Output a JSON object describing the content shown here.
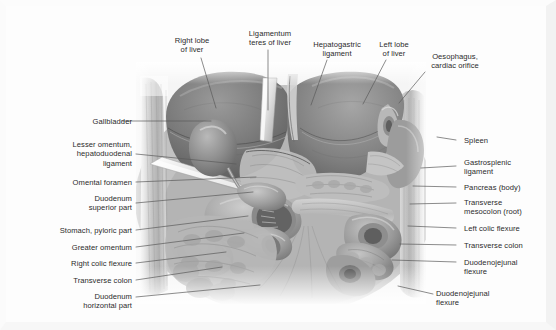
{
  "figure": {
    "illustration_name": "abdominal-viscera-illustration",
    "colors": {
      "text": "#2b2b2b",
      "leader_line": "#5a5a5a",
      "background": "#ffffff",
      "frame": "#f2f2f2",
      "liver_dark": "#6f6f6f",
      "liver_mid": "#8a8a8a",
      "viscera_light": "#b4b4b4",
      "highlight": "#dcdcdc"
    }
  },
  "labels": {
    "top": [
      {
        "id": "right-lobe-of-liver",
        "text": "Right lobe\nof liver",
        "align": "center",
        "x": 163,
        "y": 36,
        "w": 58
      },
      {
        "id": "ligamentum-teres",
        "text": "Ligamentum\nteres of liver",
        "align": "center",
        "x": 239,
        "y": 29,
        "w": 62
      },
      {
        "id": "hepatogastric-ligament",
        "text": "Hepatogastric\nligament",
        "align": "center",
        "x": 306,
        "y": 40,
        "w": 62
      },
      {
        "id": "left-lobe-of-liver",
        "text": "Left lobe\nof liver",
        "align": "center",
        "x": 371,
        "y": 40,
        "w": 46
      },
      {
        "id": "oesophagus-cardiac",
        "text": "Oesophagus,\ncardiac orifice",
        "align": "center",
        "x": 420,
        "y": 52,
        "w": 70
      }
    ],
    "left": [
      {
        "id": "gallbladder",
        "text": "Gallbladder",
        "x": 22,
        "y": 117,
        "w": 110
      },
      {
        "id": "lesser-omentum-hepatoduodenal",
        "text": "Lesser omentum,\nhepatoduodenal\nligament",
        "x": 22,
        "y": 140,
        "w": 110
      },
      {
        "id": "omental-foramen",
        "text": "Omental foramen",
        "x": 22,
        "y": 178,
        "w": 110
      },
      {
        "id": "duodenum-superior-part",
        "text": "Duodenum\nsuperior part",
        "x": 22,
        "y": 194,
        "w": 110
      },
      {
        "id": "stomach-pyloric-part",
        "text": "Stomach, pyloric part",
        "x": 12,
        "y": 226,
        "w": 120
      },
      {
        "id": "greater-omentum",
        "text": "Greater omentum",
        "x": 22,
        "y": 243,
        "w": 110
      },
      {
        "id": "right-colic-flexure",
        "text": "Right colic flexure",
        "x": 22,
        "y": 259,
        "w": 110
      },
      {
        "id": "transverse-colon-left",
        "text": "Transverse colon",
        "x": 22,
        "y": 276,
        "w": 110
      },
      {
        "id": "duodenum-horizontal-part",
        "text": "Duodenum\nhorizontal part",
        "x": 22,
        "y": 292,
        "w": 110
      }
    ],
    "right": [
      {
        "id": "spleen",
        "text": "Spleen",
        "x": 464,
        "y": 136,
        "w": 86
      },
      {
        "id": "gastrosplenic-ligament",
        "text": "Gastrosplenic\nligament",
        "x": 464,
        "y": 158,
        "w": 86
      },
      {
        "id": "pancreas-body",
        "text": "Pancreas (body)",
        "x": 464,
        "y": 183,
        "w": 86
      },
      {
        "id": "transverse-mesocolon-root",
        "text": "Transverse\nmesocolon (root)",
        "x": 464,
        "y": 198,
        "w": 86
      },
      {
        "id": "left-colic-flexure",
        "text": "Left colic flexure",
        "x": 464,
        "y": 224,
        "w": 86
      },
      {
        "id": "transverse-colon-right",
        "text": "Transverse colon",
        "x": 464,
        "y": 241,
        "w": 86
      },
      {
        "id": "duodenojejunal-flexure",
        "text": "Duodenojejunal\nflexure",
        "x": 464,
        "y": 258,
        "w": 86
      }
    ],
    "bottom_right": [
      {
        "id": "duodenojejunal-flexure-lower",
        "text": "Duodenojejunal\nflexure",
        "x": 436,
        "y": 289,
        "w": 90
      }
    ]
  },
  "leader_lines": {
    "name": "label-leader-lines",
    "top": [
      {
        "id": "leader-right-lobe",
        "d": "M 201 58  L 216 108"
      },
      {
        "id": "leader-ligamentum-teres",
        "d": "M 268 50  L 268 110"
      },
      {
        "id": "leader-hepatogastric",
        "d": "M 327 60  L 311 105"
      },
      {
        "id": "leader-left-lobe",
        "d": "M 386 60  L 363 104"
      },
      {
        "id": "leader-oesophagus",
        "d": "M 425 72  L 399 103"
      }
    ],
    "left": [
      {
        "id": "leader-gallbladder",
        "d": "M 122 121 L 211 121"
      },
      {
        "id": "leader-lesser-omentum",
        "d": "M 136 154 L 236 164"
      },
      {
        "id": "leader-omental-foramen",
        "d": "M 136 182 L 256 177"
      },
      {
        "id": "leader-duodenum-superior",
        "d": "M 136 203 L 253 192"
      },
      {
        "id": "leader-stomach-pyloric",
        "d": "M 136 230 L 248 216"
      },
      {
        "id": "leader-greater-omentum",
        "d": "M 136 247 L 244 233"
      },
      {
        "id": "leader-right-colic-flexure",
        "d": "M 136 263 L 226 252"
      },
      {
        "id": "leader-transverse-colon-left",
        "d": "M 136 280 L 222 267"
      },
      {
        "id": "leader-duodenum-horizontal",
        "d": "M 136 297 L 260 285"
      }
    ],
    "right": [
      {
        "id": "leader-spleen",
        "d": "M 456 140 L 437 137"
      },
      {
        "id": "leader-gastrosplenic",
        "d": "M 456 166 L 421 168"
      },
      {
        "id": "leader-pancreas-body",
        "d": "M 456 187 L 413 186"
      },
      {
        "id": "leader-transverse-mesocolon",
        "d": "M 456 203 L 410 204"
      },
      {
        "id": "leader-left-colic-flexure",
        "d": "M 456 228 L 408 226"
      },
      {
        "id": "leader-transverse-colon-r",
        "d": "M 456 245 L 400 244"
      },
      {
        "id": "leader-duodenojejunal",
        "d": "M 456 262 L 392 260"
      },
      {
        "id": "leader-duodenojejunal-lower",
        "d": "M 433 294 L 398 286"
      }
    ]
  }
}
